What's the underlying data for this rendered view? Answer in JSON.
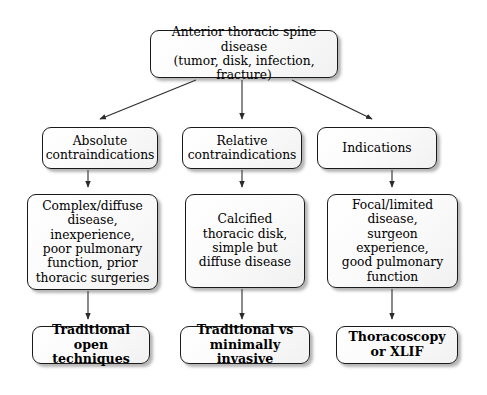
{
  "diagram": {
    "root": {
      "label": "Anterior thoracic spine disease\n(tumor, disk, infection, fracture)",
      "line1": "Anterior thoracic spine disease",
      "line2": "(tumor, disk, infection, fracture)"
    },
    "columns": [
      {
        "category": "Absolute\ncontraindications",
        "category_line1": "Absolute",
        "category_line2": "contraindications",
        "detail": "Complex/diffuse disease, inexperience, poor pulmonary function, prior thoracic surgeries",
        "detail_lines": [
          "Complex/diffuse",
          "disease,",
          "inexperience,",
          "poor pulmonary",
          "function, prior",
          "thoracic surgeries"
        ],
        "outcome": "Traditional open techniques",
        "outcome_line1": "Traditional",
        "outcome_line2": "open techniques"
      },
      {
        "category": "Relative\ncontraindications",
        "category_line1": "Relative",
        "category_line2": "contraindications",
        "detail": "Calcified thoracic disk, simple but diffuse disease",
        "detail_lines": [
          "Calcified",
          "thoracic disk,",
          "simple but",
          "diffuse disease"
        ],
        "outcome": "Traditional vs minimally invasive",
        "outcome_line1": "Traditional vs",
        "outcome_line2": "minimally invasive"
      },
      {
        "category": "Indications",
        "category_line1": "Indications",
        "category_line2": "",
        "detail": "Focal/limited disease, surgeon experience, good pulmonary function",
        "detail_lines": [
          "Focal/limited disease,",
          "surgeon experience,",
          "good pulmonary",
          "function"
        ],
        "outcome": "Thoracoscopy or XLIF",
        "outcome_line1": "Thoracoscopy",
        "outcome_line2": "or XLIF"
      }
    ],
    "style": {
      "line_color": "#2b2b2b",
      "box_border": "#1a1a1a",
      "box_fill": "#fafafa",
      "text_color": "#000000",
      "background": "#ffffff"
    }
  }
}
